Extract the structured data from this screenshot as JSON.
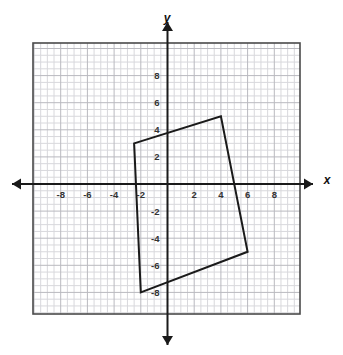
{
  "figure": {
    "type": "coordinate-plane",
    "background_color": "#ffffff",
    "plot_border_color": "#4a4a4a",
    "minor_grid_color": "#d8d8dc",
    "major_grid_color": "#b9b9bf",
    "axis_color": "#1a1a1a",
    "shape_color": "#1a1a1a",
    "label_color": "#333333"
  },
  "axes": {
    "x_label": "x",
    "y_label": "y",
    "x_ticks": [
      {
        "value": -8,
        "label": "-8"
      },
      {
        "value": -6,
        "label": "-6"
      },
      {
        "value": -4,
        "label": "-4"
      },
      {
        "value": -2,
        "label": "-2"
      },
      {
        "value": 2,
        "label": "2"
      },
      {
        "value": 4,
        "label": "4"
      },
      {
        "value": 6,
        "label": "6"
      },
      {
        "value": 8,
        "label": "8"
      }
    ],
    "y_ticks": [
      {
        "value": 8,
        "label": "8"
      },
      {
        "value": 6,
        "label": "6"
      },
      {
        "value": 4,
        "label": "4"
      },
      {
        "value": 2,
        "label": "2"
      },
      {
        "value": -2,
        "label": "-2"
      },
      {
        "value": -4,
        "label": "-4"
      },
      {
        "value": -6,
        "label": "-6"
      },
      {
        "value": -8,
        "label": "-8"
      }
    ],
    "x_range": [
      -10,
      10
    ],
    "y_range": [
      -10,
      10
    ],
    "major_grid_step": 2,
    "minor_grid_step": 1,
    "grid": true,
    "arrows": [
      "left",
      "right",
      "up",
      "down"
    ]
  },
  "chart_data": {
    "type": "scatter",
    "title": "",
    "xlabel": "x",
    "ylabel": "y",
    "xlim": [
      -10,
      10
    ],
    "ylim": [
      -10,
      10
    ],
    "grid": true,
    "shapes": [
      {
        "name": "quadrilateral",
        "closed": true,
        "fill": "none",
        "stroke": "#1a1a1a",
        "stroke_width": 2,
        "vertices": [
          {
            "x": -2.5,
            "y": 3
          },
          {
            "x": 4,
            "y": 5
          },
          {
            "x": 6,
            "y": -5
          },
          {
            "x": -2,
            "y": -8
          }
        ]
      }
    ]
  }
}
